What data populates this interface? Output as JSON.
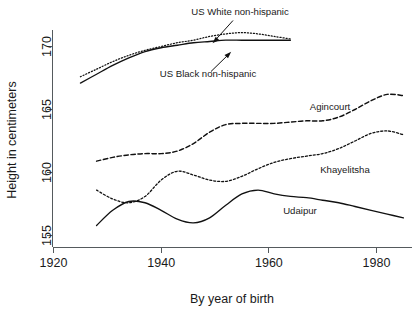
{
  "chart_data": {
    "type": "line",
    "title": "",
    "xlabel": "By year of birth",
    "ylabel": "Height in centimeters",
    "xlim": [
      1918,
      1986
    ],
    "ylim": [
      153.6,
      172.2
    ],
    "xticks": [
      1920,
      1940,
      1960,
      1980
    ],
    "xticklabels": [
      "1920",
      "1940",
      "1960",
      "1980"
    ],
    "yticks": [
      155,
      160,
      165,
      170
    ],
    "yticklabels": [
      "155",
      "160",
      "165",
      "170"
    ],
    "grid": false,
    "legend_position": "inline-annotations",
    "series": [
      {
        "name": "US White non-hispanic",
        "style": "fine-dotted",
        "label_type": "callout",
        "x": [
          1925,
          1928,
          1931,
          1934,
          1937,
          1940,
          1943,
          1946,
          1949,
          1952,
          1955,
          1958,
          1961,
          1964
        ],
        "y": [
          167.6,
          168.2,
          168.8,
          169.3,
          169.7,
          170.0,
          170.3,
          170.5,
          170.8,
          171.0,
          171.1,
          171.0,
          170.8,
          170.6
        ]
      },
      {
        "name": "US Black non-hispanic",
        "style": "solid",
        "label_type": "callout",
        "x": [
          1925,
          1928,
          1931,
          1934,
          1937,
          1940,
          1943,
          1946,
          1949,
          1952,
          1955,
          1958,
          1961,
          1964
        ],
        "y": [
          167.1,
          167.8,
          168.5,
          169.1,
          169.6,
          169.9,
          170.1,
          170.3,
          170.4,
          170.5,
          170.5,
          170.5,
          170.5,
          170.5
        ]
      },
      {
        "name": "Agincourt",
        "style": "long-dashed",
        "label_type": "inline",
        "x": [
          1928,
          1931,
          1934,
          1937,
          1940,
          1943,
          1946,
          1949,
          1952,
          1955,
          1958,
          1961,
          1964,
          1967,
          1970,
          1973,
          1976,
          1979,
          1982,
          1985
        ],
        "y": [
          160.9,
          161.2,
          161.4,
          161.5,
          161.5,
          161.7,
          162.3,
          163.2,
          163.8,
          163.9,
          163.9,
          163.9,
          164.0,
          164.1,
          164.1,
          164.4,
          165.0,
          165.7,
          166.2,
          166.1
        ]
      },
      {
        "name": "Khayelitsha",
        "style": "med-dotted",
        "label_type": "inline",
        "x": [
          1928,
          1931,
          1934,
          1937,
          1940,
          1943,
          1946,
          1949,
          1952,
          1955,
          1958,
          1961,
          1964,
          1967,
          1970,
          1973,
          1976,
          1979,
          1982,
          1985
        ],
        "y": [
          158.6,
          157.9,
          157.6,
          158.1,
          159.4,
          160.1,
          159.8,
          159.4,
          159.3,
          159.7,
          160.3,
          160.8,
          161.1,
          161.3,
          161.5,
          161.9,
          162.5,
          163.1,
          163.3,
          163.0
        ]
      },
      {
        "name": "Udaipur",
        "style": "solid",
        "label_type": "inline",
        "x": [
          1928,
          1931,
          1934,
          1937,
          1940,
          1943,
          1946,
          1949,
          1952,
          1955,
          1958,
          1961,
          1964,
          1967,
          1970,
          1973,
          1976,
          1979,
          1982,
          1985
        ],
        "y": [
          155.8,
          157.0,
          157.7,
          157.6,
          157.0,
          156.3,
          156.0,
          156.4,
          157.4,
          158.3,
          158.6,
          158.3,
          158.1,
          158.0,
          157.8,
          157.6,
          157.3,
          157.0,
          156.7,
          156.4
        ]
      }
    ]
  },
  "axes": {
    "y_title": "Height in centimeters",
    "x_title": "By year of birth",
    "y_tick_labels": [
      "170",
      "165",
      "160",
      "155"
    ],
    "x_tick_labels": [
      "1920",
      "1940",
      "1960",
      "1980"
    ]
  },
  "annotations": {
    "us_white": "US White non-hispanic",
    "us_black": "US Black non-hispanic",
    "agincourt": "Agincourt",
    "khayelitsha": "Khayelitsha",
    "udaipur": "Udaipur"
  },
  "colors": {
    "ink": "#111111",
    "axis": "#555a5d",
    "background": "#ffffff"
  }
}
